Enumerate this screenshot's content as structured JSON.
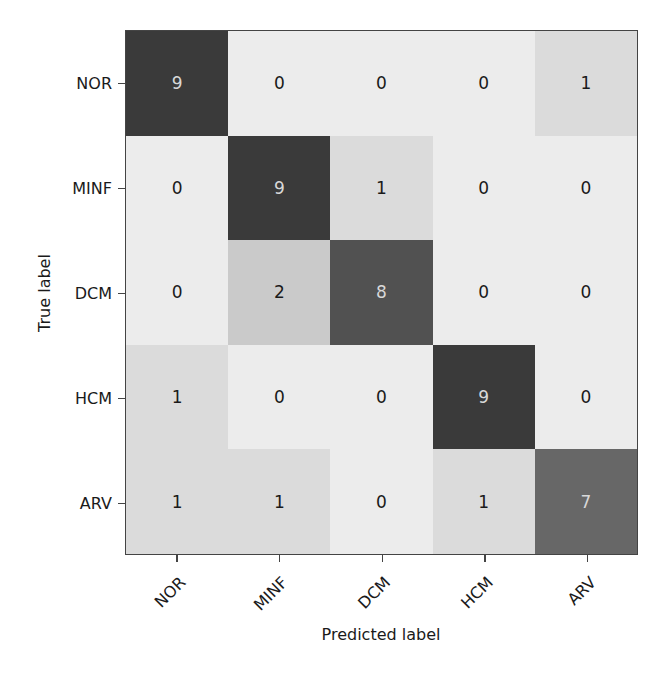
{
  "chart_data": {
    "type": "heatmap",
    "title": "",
    "xlabel": "Predicted label",
    "ylabel": "True label",
    "x_categories": [
      "NOR",
      "MINF",
      "DCM",
      "HCM",
      "ARV"
    ],
    "y_categories": [
      "NOR",
      "MINF",
      "DCM",
      "HCM",
      "ARV"
    ],
    "values": [
      [
        9,
        0,
        0,
        0,
        1
      ],
      [
        0,
        9,
        1,
        0,
        0
      ],
      [
        0,
        2,
        8,
        0,
        0
      ],
      [
        1,
        0,
        0,
        9,
        0
      ],
      [
        1,
        1,
        0,
        1,
        7
      ]
    ],
    "colormap": "greys",
    "value_range": [
      0,
      9
    ],
    "grid": false,
    "legend": "none"
  },
  "colors": {
    "low": "#ececec",
    "high": "#3a3a3a",
    "text_dark": "#1a1a1a",
    "text_light": "#d8d8d8"
  }
}
